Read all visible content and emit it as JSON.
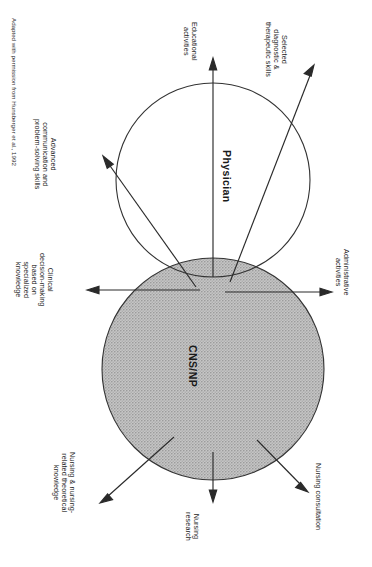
{
  "figure": {
    "type": "venn-overlap-diagram",
    "orientation": "rotated-90-counterclockwise",
    "credit": "Adapted with permission from Hunsberger et al., 1992",
    "circles": [
      {
        "id": "physician",
        "label": "Physician",
        "fill": "white",
        "stroke": "#333333"
      },
      {
        "id": "cns_np",
        "label": "CNS/NP",
        "fill": "stippled-grey",
        "stroke": "#333333"
      }
    ],
    "colors": {
      "stroke": "#333333",
      "text": "#1a1a1a",
      "shade": "#b9b9b9",
      "background": "#ffffff"
    },
    "callouts": [
      {
        "id": "educational",
        "label": "Educational\nactivities",
        "line1": "Educational",
        "line2": "activities",
        "origin": "overlap",
        "direction": "up"
      },
      {
        "id": "diagnostic",
        "label": "Selected diagnostic & therapeutic skills",
        "line1": "Selected",
        "line2": "diagnostic &",
        "line3": "therapeutic skills",
        "origin": "overlap",
        "direction": "up-right"
      },
      {
        "id": "communication",
        "label": "Advanced communication and problem-solving skills",
        "line1": "Advanced",
        "line2": "communication and",
        "line3": "problem-solving skills",
        "origin": "overlap",
        "direction": "up-left"
      },
      {
        "id": "clinical_decision",
        "label": "Clinical decision-making based on specialized knowledge",
        "line1": "Clinical",
        "line2": "decision-making",
        "line3": "based on",
        "line4": "specialized",
        "line5": "knowledge",
        "origin": "overlap",
        "direction": "left"
      },
      {
        "id": "administrative",
        "label": "Administrative activities",
        "line1": "Administrative",
        "line2": "activities",
        "origin": "overlap",
        "direction": "right"
      },
      {
        "id": "nursing_knowledge",
        "label": "Nursing & nursing-related theoretical knowledge",
        "line1": "Nursing & nursing-",
        "line2": "related theoretical",
        "line3": "knowledge",
        "origin": "cns_np",
        "direction": "down-left"
      },
      {
        "id": "nursing_research",
        "label": "Nursing research",
        "line1": "Nursing",
        "line2": "research",
        "origin": "cns_np",
        "direction": "down"
      },
      {
        "id": "nursing_consultation",
        "label": "Nursing consultation",
        "line1": "Nursing consultation",
        "origin": "cns_np",
        "direction": "down-right"
      }
    ]
  }
}
